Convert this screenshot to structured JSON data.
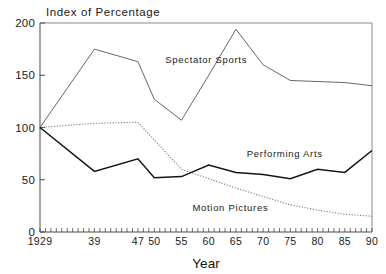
{
  "chart_data": {
    "type": "line",
    "title": "Index of Percentage",
    "xlabel": "Year",
    "ylabel": "",
    "xlim": [
      1929,
      1990
    ],
    "ylim": [
      0,
      200
    ],
    "grid": false,
    "legend_position": "inline-annotations",
    "yticks": [
      0,
      50,
      100,
      150,
      200
    ],
    "ytick_labels": [
      "0",
      "50",
      "100",
      "150",
      "200"
    ],
    "xticks": [
      1929,
      1939,
      1947,
      1950,
      1955,
      1960,
      1965,
      1970,
      1975,
      1980,
      1985,
      1990
    ],
    "xtick_labels": [
      "1929",
      "39",
      "47",
      "50",
      "55",
      "60",
      "65",
      "70",
      "75",
      "80",
      "85",
      "90"
    ],
    "x": [
      1929,
      1939,
      1947,
      1950,
      1955,
      1960,
      1965,
      1970,
      1975,
      1980,
      1985,
      1990
    ],
    "series": [
      {
        "name": "Spectator Sports",
        "style": "solid",
        "color": "#555555",
        "values": [
          100,
          175,
          163,
          127,
          107,
          150,
          194,
          160,
          145,
          144,
          143,
          140
        ],
        "label_x": 1952,
        "label_y": 162
      },
      {
        "name": "Performing Arts",
        "style": "solid-bold",
        "color": "#141414",
        "values": [
          100,
          58,
          70,
          52,
          53,
          64,
          57,
          55,
          51,
          60,
          57,
          78
        ],
        "label_x": 1967,
        "label_y": 72
      },
      {
        "name": "Motion Pictures",
        "style": "dotted",
        "color": "#7d7d7d",
        "values": [
          100,
          104,
          105,
          88,
          60,
          51,
          42,
          34,
          26,
          21,
          17,
          15
        ],
        "label_x": 1957,
        "label_y": 20
      }
    ],
    "annotations": [
      {
        "text": "Spectator Sports",
        "series": "Spectator Sports"
      },
      {
        "text": "Performing Arts",
        "series": "Performing Arts"
      },
      {
        "text": "Motion Pictures",
        "series": "Motion Pictures"
      }
    ]
  }
}
